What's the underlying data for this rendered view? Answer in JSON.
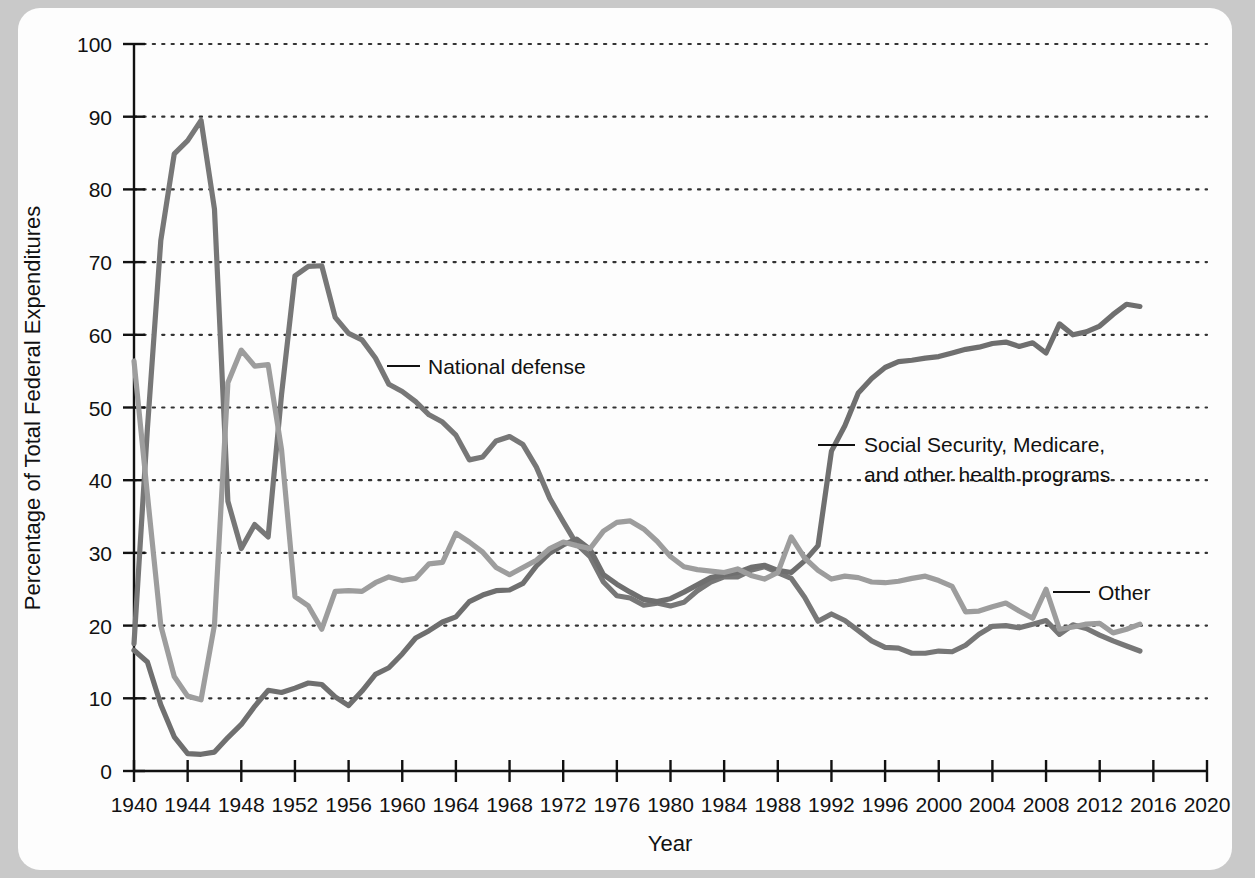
{
  "chart_data": {
    "type": "line",
    "title": "",
    "xlabel": "Year",
    "ylabel": "Percentage of Total Federal Expenditures",
    "xlim": [
      1940,
      2020
    ],
    "ylim": [
      0,
      100
    ],
    "xticks": [
      1940,
      1944,
      1948,
      1952,
      1956,
      1960,
      1964,
      1968,
      1972,
      1976,
      1980,
      1984,
      1988,
      1992,
      1996,
      2000,
      2004,
      2008,
      2012,
      2016,
      2020
    ],
    "yticks": [
      0,
      10,
      20,
      30,
      40,
      50,
      60,
      70,
      80,
      90,
      100
    ],
    "grid": "horizontal-dotted",
    "legend_position": "inline-annotations",
    "series": [
      {
        "name": "National defense",
        "color": "#777777",
        "label_anchor_year": 1962,
        "label_anchor_value": 57,
        "x": [
          1940,
          1941,
          1942,
          1943,
          1944,
          1945,
          1946,
          1947,
          1948,
          1949,
          1950,
          1951,
          1952,
          1953,
          1954,
          1955,
          1956,
          1957,
          1958,
          1959,
          1960,
          1961,
          1962,
          1963,
          1964,
          1965,
          1966,
          1967,
          1968,
          1969,
          1970,
          1971,
          1972,
          1973,
          1974,
          1975,
          1976,
          1977,
          1978,
          1979,
          1980,
          1981,
          1982,
          1983,
          1984,
          1985,
          1986,
          1987,
          1988,
          1989,
          1990,
          1991,
          1992,
          1993,
          1994,
          1995,
          1996,
          1997,
          1998,
          1999,
          2000,
          2001,
          2002,
          2003,
          2004,
          2005,
          2006,
          2007,
          2008,
          2009,
          2010,
          2011,
          2012,
          2013,
          2014,
          2015
        ],
        "y": [
          17.5,
          47.1,
          73.0,
          84.9,
          86.7,
          89.5,
          77.3,
          37.1,
          30.6,
          33.9,
          32.2,
          51.8,
          68.1,
          69.4,
          69.5,
          62.4,
          60.2,
          59.3,
          56.8,
          53.2,
          52.2,
          50.8,
          49.0,
          48.0,
          46.2,
          42.8,
          43.2,
          45.4,
          46.0,
          44.9,
          41.8,
          37.5,
          34.3,
          31.2,
          29.5,
          26.0,
          24.1,
          23.8,
          22.8,
          23.1,
          22.7,
          23.2,
          24.8,
          26.0,
          26.7,
          26.7,
          27.6,
          28.1,
          27.3,
          26.5,
          23.9,
          20.6,
          21.6,
          20.7,
          19.3,
          17.9,
          17.0,
          16.9,
          16.2,
          16.2,
          16.5,
          16.4,
          17.3,
          18.8,
          19.9,
          20.0,
          19.7,
          20.2,
          20.7,
          18.8,
          20.1,
          19.6,
          18.7,
          17.9,
          17.2,
          16.5
        ]
      },
      {
        "name": "Social Security, Medicare, and other health programs",
        "color": "#6f6f6f",
        "label_line1": "Social Security, Medicare,",
        "label_line2": "and other health programs",
        "label_anchor_year": 1991,
        "label_anchor_value": 47,
        "x": [
          1940,
          1941,
          1942,
          1943,
          1944,
          1945,
          1946,
          1947,
          1948,
          1949,
          1950,
          1951,
          1952,
          1953,
          1954,
          1955,
          1956,
          1957,
          1958,
          1959,
          1960,
          1961,
          1962,
          1963,
          1964,
          1965,
          1966,
          1967,
          1968,
          1969,
          1970,
          1971,
          1972,
          1973,
          1974,
          1975,
          1976,
          1977,
          1978,
          1979,
          1980,
          1981,
          1982,
          1983,
          1984,
          1985,
          1986,
          1987,
          1988,
          1989,
          1990,
          1991,
          1992,
          1993,
          1994,
          1995,
          1996,
          1997,
          1998,
          1999,
          2000,
          2001,
          2002,
          2003,
          2004,
          2005,
          2006,
          2007,
          2008,
          2009,
          2010,
          2011,
          2012,
          2013,
          2014,
          2015
        ],
        "y": [
          16.6,
          15.0,
          9.1,
          4.7,
          2.4,
          2.3,
          2.6,
          4.6,
          6.4,
          8.9,
          11.1,
          10.8,
          11.4,
          12.1,
          11.9,
          10.2,
          9.0,
          11.0,
          13.3,
          14.2,
          16.1,
          18.3,
          19.3,
          20.5,
          21.2,
          23.3,
          24.2,
          24.8,
          24.9,
          25.8,
          28.2,
          30.0,
          31.1,
          31.9,
          30.5,
          27.0,
          25.7,
          24.6,
          23.6,
          23.3,
          23.7,
          24.6,
          25.6,
          26.6,
          27.0,
          27.3,
          28.0,
          28.3,
          27.6,
          27.3,
          28.9,
          31.0,
          44.0,
          47.5,
          52.0,
          54.0,
          55.5,
          56.3,
          56.5,
          56.8,
          57.0,
          57.5,
          58.0,
          58.3,
          58.8,
          59.0,
          58.4,
          58.9,
          57.5,
          61.5,
          60.0,
          60.4,
          61.2,
          62.8,
          64.2,
          63.9
        ]
      },
      {
        "name": "Other",
        "color": "#9d9d9d",
        "label_anchor_year": 2009,
        "label_anchor_value": 26,
        "x": [
          1940,
          1941,
          1942,
          1943,
          1944,
          1945,
          1946,
          1947,
          1948,
          1949,
          1950,
          1951,
          1952,
          1953,
          1954,
          1955,
          1956,
          1957,
          1958,
          1959,
          1960,
          1961,
          1962,
          1963,
          1964,
          1965,
          1966,
          1967,
          1968,
          1969,
          1970,
          1971,
          1972,
          1973,
          1974,
          1975,
          1976,
          1977,
          1978,
          1979,
          1980,
          1981,
          1982,
          1983,
          1984,
          1985,
          1986,
          1987,
          1988,
          1989,
          1990,
          1991,
          1992,
          1993,
          1994,
          1995,
          1996,
          1997,
          1998,
          1999,
          2000,
          2001,
          2002,
          2003,
          2004,
          2005,
          2006,
          2007,
          2008,
          2009,
          2010,
          2011,
          2012,
          2013,
          2014,
          2015
        ],
        "y": [
          56.4,
          38.0,
          20.0,
          13.0,
          10.3,
          9.8,
          20.1,
          53.4,
          57.9,
          55.7,
          55.9,
          44.2,
          24.0,
          22.7,
          19.5,
          24.7,
          24.8,
          24.7,
          25.9,
          26.7,
          26.2,
          26.5,
          28.5,
          28.7,
          32.7,
          31.5,
          30.1,
          28.0,
          27.0,
          28.0,
          29.0,
          30.6,
          31.5,
          31.0,
          30.6,
          33.0,
          34.2,
          34.4,
          33.3,
          31.6,
          29.5,
          28.1,
          27.7,
          27.5,
          27.3,
          27.8,
          26.9,
          26.4,
          27.3,
          32.2,
          29.3,
          27.6,
          26.4,
          26.8,
          26.6,
          26.0,
          25.9,
          26.1,
          26.5,
          26.8,
          26.2,
          25.4,
          21.9,
          22.0,
          22.6,
          23.1,
          22.0,
          21.0,
          25.0,
          19.5,
          19.8,
          20.2,
          20.3,
          19.0,
          19.5,
          20.2
        ]
      }
    ]
  },
  "axes": {
    "y_title": "Percentage of Total Federal Expenditures",
    "x_title": "Year",
    "y_tick_labels": [
      "0",
      "10",
      "20",
      "30",
      "40",
      "50",
      "60",
      "70",
      "80",
      "90",
      "100"
    ],
    "x_tick_labels": [
      "1940",
      "1944",
      "1948",
      "1952",
      "1956",
      "1960",
      "1964",
      "1968",
      "1972",
      "1976",
      "1980",
      "1984",
      "1988",
      "1992",
      "1996",
      "2000",
      "2004",
      "2008",
      "2012",
      "2016",
      "2020"
    ]
  },
  "annotations": {
    "national_defense": "National defense",
    "social_security_line1": "Social Security, Medicare,",
    "social_security_line2": "and other health programs",
    "other": "Other"
  },
  "colors": {
    "background": "#c9c9c9",
    "card": "#fdfdfd",
    "axis": "#111111",
    "grid": "#333333",
    "national_defense": "#777777",
    "social_security": "#6f6f6f",
    "other": "#9d9d9d"
  }
}
